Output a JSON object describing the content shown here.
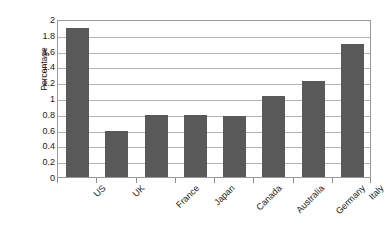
{
  "chart_data": {
    "type": "bar",
    "title": "",
    "xlabel": "",
    "ylabel": "Percentage",
    "categories": [
      "US",
      "UK",
      "France",
      "Japan",
      "Canada",
      "Australia",
      "Germany",
      "Italy"
    ],
    "values": [
      1.89,
      0.58,
      0.78,
      0.78,
      0.77,
      1.03,
      1.22,
      1.68
    ],
    "ylim": [
      0,
      2
    ],
    "ytick_step": 0.2,
    "ytick_labels": [
      "0",
      "0.2",
      "0.4",
      "0.6",
      "0.8",
      "1",
      "1.2",
      "1.4",
      "1.6",
      "1.8",
      "2"
    ],
    "grid": true,
    "legend": "none",
    "series": [
      {
        "name": "Percentage",
        "values": [
          1.89,
          0.58,
          0.78,
          0.78,
          0.77,
          1.03,
          1.22,
          1.68
        ]
      }
    ],
    "colors": {
      "bar_fill": "#595959",
      "gridline": "#b4b4b4",
      "plot_border": "#9a9a9a",
      "text": "#1a1a1a",
      "background": "#ffffff"
    }
  }
}
